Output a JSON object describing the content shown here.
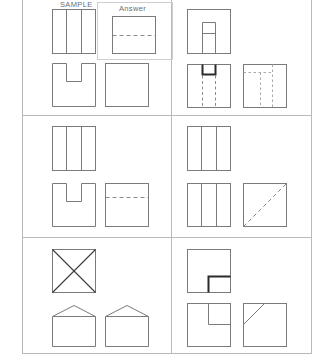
{
  "worksheet": {
    "title": "Orthographic projection practice sheet",
    "sample_label": "SAMPLE",
    "answer_label": "Answer",
    "page_background": "#ffffff",
    "line_color": "#7b7b7b",
    "grid_color": "#b9b9b9",
    "accent_dark": "#2b2b2b"
  },
  "grid": {
    "columns": 2,
    "rows": 3,
    "vertical_divider_x": 171,
    "horizontal_divider_y": [
      115,
      237
    ],
    "outer_left": 22,
    "outer_right": 312,
    "outer_bottom": 354
  },
  "problems": [
    {
      "id": "sample",
      "position": "row1-col1",
      "caption": "SAMPLE",
      "has_answer_box": true,
      "answer_caption": "Answer",
      "top_view": {
        "name": "three-strip-rectangle",
        "shape": "rectangle with two interior vertical dividers",
        "divisions": 3
      },
      "front_view": {
        "name": "u-notch-block",
        "shape": "square with rectangular notch cut from top centre"
      },
      "side_view": {
        "name": "plain-square",
        "shape": "empty square"
      },
      "answer_figure": {
        "name": "square-with-horizontal-dashed-line",
        "shape": "square with one horizontal hidden (dashed) line across the middle"
      }
    },
    {
      "id": "problem-1",
      "position": "row1-col2",
      "caption": "",
      "has_answer_box": false,
      "top_view": {
        "name": "square-with-inner-tab",
        "shape": "square containing a small vertical rectangle rising from the bottom edge at centre"
      },
      "front_view": {
        "name": "square-with-top-notch-and-dashed-lines",
        "shape": "square with a heavy U notch at top centre and two vertical dashed hidden lines below"
      },
      "side_view": {
        "name": "square-with-dashed-inner-rectangle",
        "shape": "square with fine dashed lines forming an inner rectangle open to the left"
      }
    },
    {
      "id": "problem-2",
      "position": "row2-col1",
      "caption": "",
      "has_answer_box": false,
      "top_view": {
        "name": "three-strip-rectangle",
        "shape": "rectangle with two interior vertical dividers",
        "divisions": 3
      },
      "front_view": {
        "name": "u-notch-block",
        "shape": "square with rectangular notch cut from top centre"
      },
      "side_view": {
        "name": "square-with-horizontal-dashed-line",
        "shape": "square with one horizontal dashed hidden line in the upper third"
      }
    },
    {
      "id": "problem-3",
      "position": "row2-col2",
      "caption": "",
      "has_answer_box": false,
      "top_view": {
        "name": "three-strip-rectangle",
        "shape": "rectangle with two interior vertical dividers",
        "divisions": 3
      },
      "front_view": {
        "name": "three-strip-rectangle",
        "shape": "rectangle with two interior vertical dividers",
        "divisions": 3
      },
      "side_view": {
        "name": "square-with-dashed-diagonal",
        "shape": "square with a dashed diagonal line from bottom-left to top-right"
      }
    },
    {
      "id": "problem-4",
      "position": "row3-col1",
      "caption": "",
      "has_answer_box": false,
      "top_view": {
        "name": "square-with-x-diagonals",
        "shape": "square crossed by both diagonals forming an X"
      },
      "front_view": {
        "name": "house-pentagon",
        "shape": "square topped by a shallow triangular gable"
      },
      "side_view": {
        "name": "house-pentagon",
        "shape": "square topped by a shallow triangular gable"
      }
    },
    {
      "id": "problem-5",
      "position": "row3-col2",
      "caption": "",
      "has_answer_box": false,
      "top_view": {
        "name": "square-with-thick-corner-step",
        "shape": "square with a heavy L-shaped step line in the lower-right quadrant"
      },
      "front_view": {
        "name": "square-with-corner-step",
        "shape": "square with an L-shaped step line in the upper-right quadrant"
      },
      "side_view": {
        "name": "square-with-corner-diagonal",
        "shape": "square with a short diagonal chamfer line at the upper-left corner"
      }
    }
  ]
}
